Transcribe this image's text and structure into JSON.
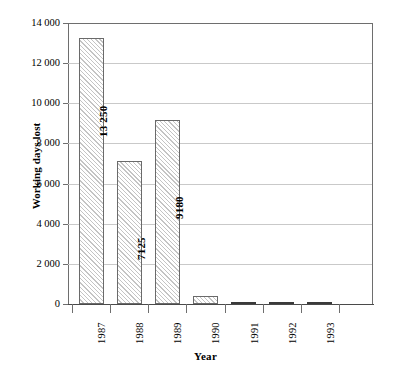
{
  "chart_data": {
    "type": "bar",
    "title": "",
    "xlabel": "Year",
    "ylabel": "Working days lost",
    "categories": [
      "1987",
      "1988",
      "1989",
      "1990",
      "1991",
      "1992",
      "1993"
    ],
    "values": [
      13250,
      7125,
      9180,
      400,
      100,
      60,
      70
    ],
    "value_labels": [
      "13 250",
      "7125",
      "9180",
      "",
      "",
      "",
      ""
    ],
    "ylim": [
      0,
      14000
    ],
    "yticks": [
      0,
      2000,
      4000,
      6000,
      8000,
      10000,
      12000,
      14000
    ],
    "ytick_labels": [
      "0",
      "2 000",
      "4 000",
      "6 000",
      "8 000",
      "10 000",
      "12 000",
      "14 000"
    ],
    "grid": "horizontal",
    "legend": "none",
    "bar_fill": "diagonal-hatch",
    "colors": {
      "background": "#ffffff",
      "axis": "#6e6e6e",
      "gridline": "#c9c9c9",
      "bar_edge": "#6a6a6a",
      "bar_hatch": "#c4c4c4",
      "text": "#000000"
    }
  }
}
